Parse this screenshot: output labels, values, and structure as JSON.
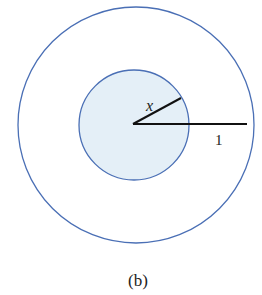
{
  "diagram": {
    "outer_circle": {
      "cx": 136,
      "cy": 125,
      "r": 118,
      "stroke": "#4a6fb5",
      "fill": "none"
    },
    "inner_circle": {
      "cx": 134,
      "cy": 125,
      "r": 55,
      "stroke": "#4a6fb5",
      "fill": "#e4eff7"
    },
    "radius_x_line": {
      "x1": 133,
      "y1": 124,
      "x2": 181,
      "y2": 98
    },
    "radius_1_line": {
      "x1": 133,
      "y1": 124,
      "x2": 247,
      "y2": 124
    },
    "labels": {
      "x": "x",
      "one": "1"
    },
    "caption": "(b)"
  }
}
